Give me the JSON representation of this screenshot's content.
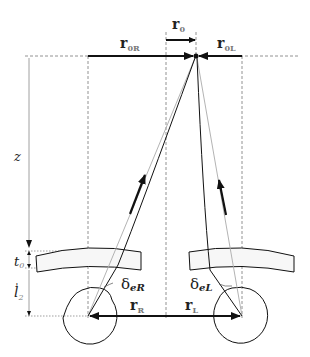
{
  "diagram": {
    "labels": {
      "r0": {
        "main": "r",
        "sub": "0"
      },
      "r0R": {
        "main": "r",
        "sub": "0R"
      },
      "r0L": {
        "main": "r",
        "sub": "0L"
      },
      "rR": {
        "main": "r",
        "sub": "R"
      },
      "rL": {
        "main": "r",
        "sub": "L"
      },
      "z": "z",
      "t0": {
        "main": "t",
        "sub": "0"
      },
      "l2": {
        "main": "l",
        "sub": "2",
        "prime": "'"
      },
      "deltaR": {
        "main": "δ",
        "sub": "eR"
      },
      "deltaL": {
        "main": "δ",
        "sub": "eL"
      }
    },
    "elements": {
      "eyes": [
        "right-eye",
        "left-eye"
      ],
      "lenses": [
        "right-lens",
        "left-lens"
      ],
      "fixation_point": "target-point"
    },
    "colors": {
      "line": "#111111",
      "dashed": "#777777",
      "ray_light": "#aaaaaa",
      "lens_fill": "#f7f7f7"
    }
  }
}
